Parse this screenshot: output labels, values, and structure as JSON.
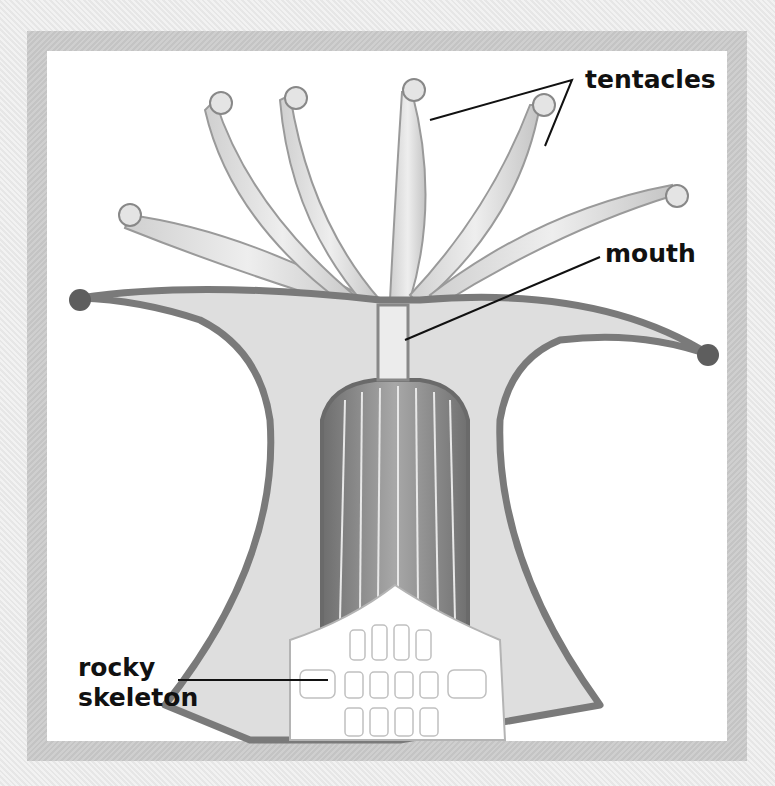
{
  "figure": {
    "labels": {
      "tentacles": "tentacles",
      "mouth": "mouth",
      "skeleton_line1": "rocky",
      "skeleton_line2": "skeleton"
    }
  },
  "colors": {
    "background": "#ebebeb",
    "frame": "#c8c8c8",
    "panel": "#ffffff",
    "body_fill": "#dcdcdc",
    "outline": "#7a7a7a",
    "label_text": "#111111"
  }
}
